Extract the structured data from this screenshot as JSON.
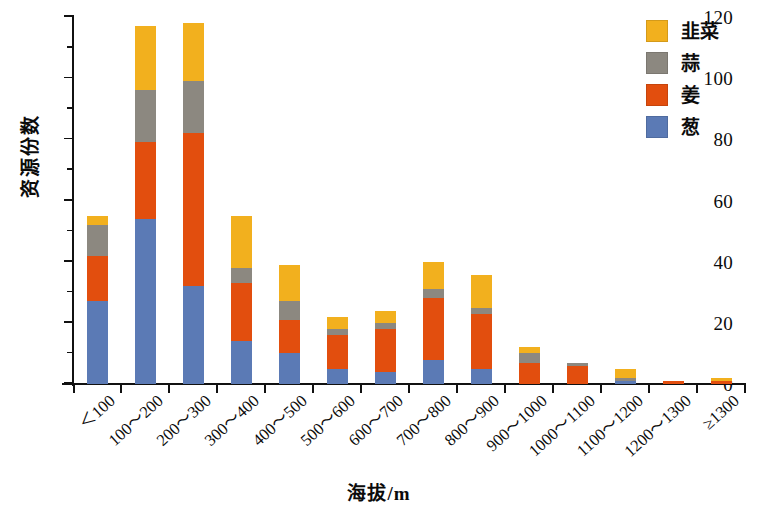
{
  "chart_data": {
    "type": "bar",
    "stacked": true,
    "title": "",
    "xlabel": "海拔/m",
    "ylabel": "资源份数",
    "ylim": [
      0,
      120
    ],
    "ytick_step": 20,
    "yticks": [
      0,
      20,
      40,
      60,
      80,
      100,
      120
    ],
    "ytick_labels": [
      "0",
      "20",
      "40",
      "60",
      "80",
      "100",
      "120"
    ],
    "minor_ytick_step": 10,
    "grid": false,
    "legend_position": "top-right",
    "categories": [
      "＜100",
      "100～200",
      "200～300",
      "300～400",
      "400～500",
      "500～600",
      "600～700",
      "700～800",
      "800～900",
      "900～1000",
      "1000～1100",
      "1100～1200",
      "1200～1300",
      "≥1300"
    ],
    "series": [
      {
        "name": "葱",
        "color": "#5B7AB5",
        "values": [
          27,
          54,
          32,
          14,
          10,
          5,
          4,
          8,
          5,
          0,
          0,
          1,
          0,
          0
        ]
      },
      {
        "name": "姜",
        "color": "#E24E0E",
        "values": [
          15,
          25,
          50,
          19,
          11,
          11,
          14,
          20,
          18,
          7,
          6,
          0,
          1,
          1
        ]
      },
      {
        "name": "蒜",
        "color": "#8C8880",
        "values": [
          10,
          17,
          17,
          5,
          6,
          2,
          2,
          3,
          2,
          3,
          1,
          1,
          0,
          0
        ]
      },
      {
        "name": "韭菜",
        "color": "#F2B01E",
        "values": [
          3,
          21,
          19,
          17,
          12,
          4,
          4,
          9,
          10.5,
          2,
          0,
          3,
          0,
          1
        ]
      }
    ],
    "totals": [
      55,
      117,
      118,
      55,
      39,
      22,
      24,
      40,
      35.5,
      12,
      7,
      5,
      1,
      2
    ],
    "legend_order": [
      "韭菜",
      "蒜",
      "姜",
      "葱"
    ]
  },
  "legend": {
    "items": [
      {
        "label": "韭菜",
        "color": "#F2B01E"
      },
      {
        "label": "蒜",
        "color": "#8C8880"
      },
      {
        "label": "姜",
        "color": "#E24E0E"
      },
      {
        "label": "葱",
        "color": "#5B7AB5"
      }
    ]
  }
}
